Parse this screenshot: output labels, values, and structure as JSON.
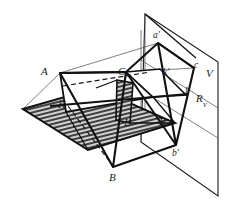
{
  "figure": {
    "background_color": "#ffffff",
    "line_color": "#1a1a1a",
    "hatch_color": "#2b2b2b",
    "hatch_fill": "#c9c9c9",
    "labels": [
      {
        "id": "A",
        "text": "A",
        "sub": "",
        "x": 41,
        "y": 66,
        "size": "cap"
      },
      {
        "id": "B",
        "text": "B",
        "sub": "",
        "x": 109,
        "y": 172,
        "size": "cap"
      },
      {
        "id": "C",
        "text": "C",
        "sub": "",
        "x": 118,
        "y": 66,
        "size": "cap"
      },
      {
        "id": "K",
        "text": "K",
        "sub": "",
        "x": 58,
        "y": 99,
        "size": "cap"
      },
      {
        "id": "L",
        "text": "L",
        "sub": "",
        "x": 124,
        "y": 117,
        "size": "cap"
      },
      {
        "id": "R",
        "text": "R",
        "sub": "",
        "x": 159,
        "y": 116,
        "size": "cap"
      },
      {
        "id": "V",
        "text": "V",
        "sub": "",
        "x": 206,
        "y": 68,
        "size": "cap"
      },
      {
        "id": "a1",
        "text": "a′",
        "sub": "",
        "x": 153,
        "y": 31,
        "size": "small"
      },
      {
        "id": "b1",
        "text": "b′",
        "sub": "",
        "x": 172,
        "y": 149,
        "size": "small"
      },
      {
        "id": "c1",
        "text": "c",
        "sub": "",
        "x": 194,
        "y": 61,
        "size": "small"
      },
      {
        "id": "k1",
        "text": "k′",
        "sub": "",
        "x": 163,
        "y": 68,
        "size": "small"
      },
      {
        "id": "l1",
        "text": "l′",
        "sub": "",
        "x": 185,
        "y": 87,
        "size": "small"
      },
      {
        "id": "Rv",
        "text": "R",
        "sub": "V",
        "x": 196,
        "y": 93,
        "size": "cap"
      }
    ],
    "vertical_plane": {
      "name": "V",
      "vertices": "145,14 218,62 218,196 141,142"
    },
    "hatched_plane": {
      "name": "auxiliary cutting plane",
      "vertices": "23,109 96,88 175,123 88,150",
      "hatch_spacing_px": 4
    },
    "triangle_space": {
      "name": "ABC",
      "vertices": "60,73 113,167 126,72"
    },
    "triangle_projection": {
      "name": "a-prime b-prime c-prime",
      "vertices": "158,43 176,145 194,68"
    },
    "trace_line": {
      "name": "K L R",
      "from": "52,105",
      "to": "186,95"
    },
    "dashed_lines": [
      {
        "name": "hidden-edge-1",
        "from": "60,85",
        "to": "150,70"
      },
      {
        "name": "hidden-edge-2",
        "from": "57,95",
        "to": "147,80"
      },
      {
        "name": "hidden-edge-3",
        "from": "67,108",
        "to": "113,167"
      }
    ]
  }
}
